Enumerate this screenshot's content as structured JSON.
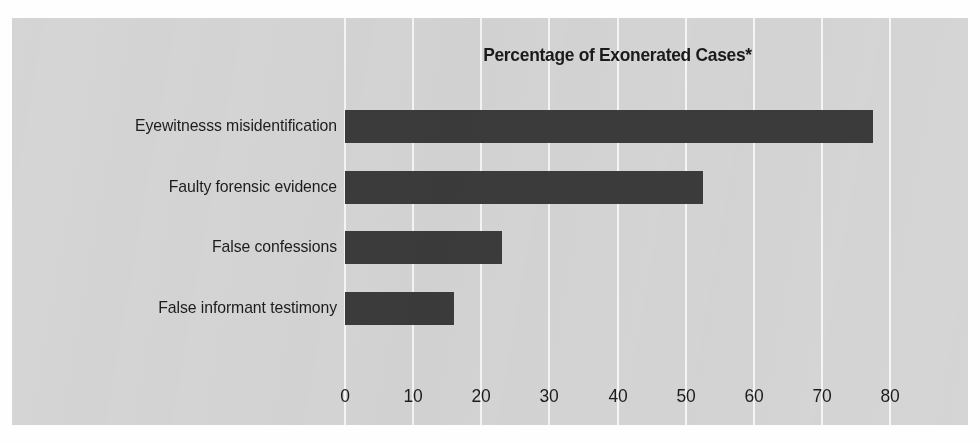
{
  "figure": {
    "background_color": "#d5d5d5",
    "page_color": "#fefefe",
    "bar_color": "#3b3b3b",
    "gridline_color": "#f6f6f6",
    "text_color": "#1d1d1d"
  },
  "chart_data": {
    "type": "bar",
    "orientation": "horizontal",
    "title": "Percentage of Exonerated Cases*",
    "xlabel": "",
    "ylabel": "",
    "xlim": [
      0,
      80
    ],
    "xticks": [
      0,
      10,
      20,
      30,
      40,
      50,
      60,
      70,
      80
    ],
    "xtick_labels": [
      "0",
      "10",
      "20",
      "30",
      "40",
      "50",
      "60",
      "70",
      "80"
    ],
    "grid": "vertical",
    "legend": "none",
    "categories": [
      "Eyewitnesss misidentification",
      "Faulty forensic evidence",
      "False confessions",
      "False informant testimony"
    ],
    "values": [
      77.5,
      52.5,
      23,
      16
    ],
    "series": [
      {
        "name": "Percentage of Exonerated Cases",
        "values": [
          77.5,
          52.5,
          23,
          16
        ]
      }
    ],
    "bars": [
      {
        "label": "Eyewitnesss misidentification",
        "value": 77.5
      },
      {
        "label": "Faulty forensic evidence",
        "value": 52.5
      },
      {
        "label": "False confessions",
        "value": 23
      },
      {
        "label": "False informant testimony",
        "value": 16
      }
    ],
    "annotations": [
      "*"
    ]
  }
}
